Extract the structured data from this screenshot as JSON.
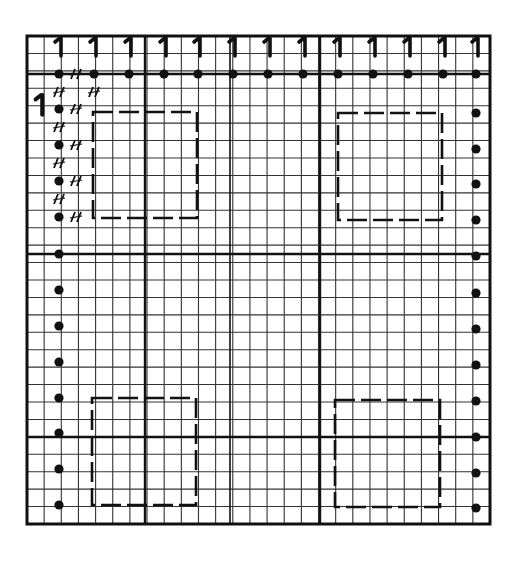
{
  "diagram": {
    "type": "knitting-chart-grid",
    "background": "#ffffff",
    "ink": "#111111",
    "grid": {
      "left": 27,
      "top": 36,
      "right": 490,
      "bottom": 524,
      "cols": 27,
      "rows": 28,
      "thick_x": [
        145,
        320
      ],
      "medium_x": [
        230
      ],
      "thick_y": [
        74,
        254,
        437
      ]
    },
    "column_marks": {
      "symbol": "1",
      "y": 48,
      "x": [
        59,
        94,
        129,
        164,
        198,
        233,
        268,
        303,
        338,
        373,
        408,
        443,
        476
      ]
    },
    "row_mark": {
      "symbol": "1",
      "x": 40,
      "y": 106
    },
    "top_dots": {
      "y": 74,
      "x": [
        59,
        94,
        129,
        164,
        198,
        233,
        268,
        303,
        338,
        373,
        408,
        443,
        476
      ]
    },
    "left_dots": {
      "x": 59,
      "y": [
        109,
        145,
        181,
        217,
        254,
        290,
        326,
        362,
        398,
        433,
        469,
        505
      ]
    },
    "right_dots": {
      "x": 476,
      "y": [
        113,
        149,
        184,
        220,
        256,
        293,
        329,
        365,
        401,
        437,
        473,
        508
      ]
    },
    "slash_marks": {
      "symbol": "//",
      "items": [
        {
          "x": 76,
          "y": 74
        },
        {
          "x": 59,
          "y": 92
        },
        {
          "x": 94,
          "y": 92
        },
        {
          "x": 76,
          "y": 109
        },
        {
          "x": 59,
          "y": 127
        },
        {
          "x": 76,
          "y": 145
        },
        {
          "x": 59,
          "y": 163
        },
        {
          "x": 76,
          "y": 181
        },
        {
          "x": 59,
          "y": 199
        },
        {
          "x": 76,
          "y": 217
        }
      ]
    },
    "dashed_rectangles": [
      {
        "name": "top-left",
        "x1": 93,
        "y1": 112,
        "x2": 197,
        "y2": 218
      },
      {
        "name": "top-right",
        "x1": 338,
        "y1": 113,
        "x2": 442,
        "y2": 220
      },
      {
        "name": "bottom-left",
        "x1": 92,
        "y1": 398,
        "x2": 196,
        "y2": 505
      },
      {
        "name": "bottom-right",
        "x1": 335,
        "y1": 400,
        "x2": 440,
        "y2": 507
      }
    ]
  }
}
